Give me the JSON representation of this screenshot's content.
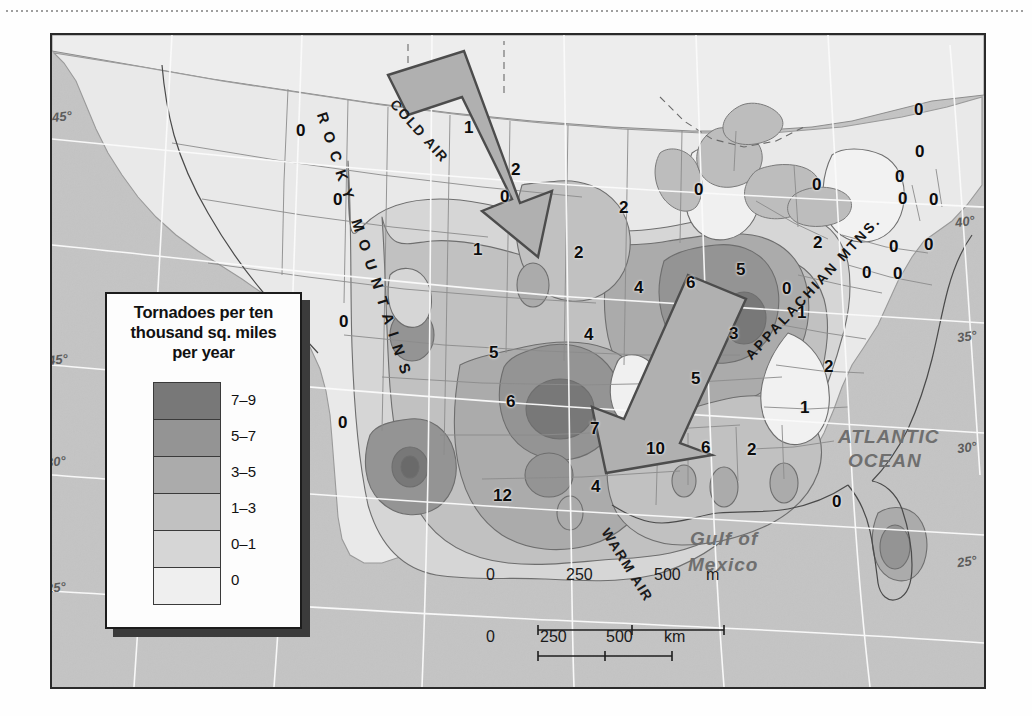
{
  "legend": {
    "title": "Tornadoes per ten thousand sq. miles per year",
    "title_lines": [
      "Tornadoes per ten",
      "thousand sq. miles",
      "per year"
    ],
    "entries": [
      {
        "label": "7–9",
        "color": "#787878"
      },
      {
        "label": "5–7",
        "color": "#949494"
      },
      {
        "label": "3–5",
        "color": "#ababab"
      },
      {
        "label": "1–3",
        "color": "#c1c1c1"
      },
      {
        "label": "0–1",
        "color": "#d6d6d6"
      },
      {
        "label": "0",
        "color": "#efefef"
      }
    ]
  },
  "map": {
    "ocean_color": "#c4c4c4",
    "land_color": "#e8e8e8",
    "frame_color": "#2a2a2a",
    "geo_labels": [
      {
        "text": "ATLANTIC",
        "x": 838,
        "y": 438,
        "size": 19
      },
      {
        "text": "OCEAN",
        "x": 848,
        "y": 462,
        "size": 19
      },
      {
        "text": "Gulf of",
        "x": 690,
        "y": 540,
        "size": 19
      },
      {
        "text": "Mexico",
        "x": 688,
        "y": 566,
        "size": 19
      }
    ],
    "range_labels": [
      {
        "text": "ROCKY MOUNTAINS",
        "x": 330,
        "y": 110,
        "rotate": 72
      },
      {
        "text": "APPALACHIAN MTNS.",
        "x": 742,
        "y": 352,
        "rotate": -47
      }
    ],
    "air_arrows": [
      {
        "text": "COLD AIR",
        "x": 399,
        "y": 96,
        "rotate": 48
      },
      {
        "text": "WARM AIR",
        "x": 612,
        "y": 525,
        "rotate": 58
      }
    ],
    "grid_labels_left": [
      {
        "text": "45°",
        "x": 52,
        "y": 117
      },
      {
        "text": "45°",
        "x": 48,
        "y": 360
      },
      {
        "text": "30°",
        "x": 46,
        "y": 462
      },
      {
        "text": "25°",
        "x": 46,
        "y": 588
      }
    ],
    "grid_labels_right": [
      {
        "text": "40°",
        "x": 955,
        "y": 222
      },
      {
        "text": "35°",
        "x": 957,
        "y": 337
      },
      {
        "text": "30°",
        "x": 957,
        "y": 448
      },
      {
        "text": "25°",
        "x": 957,
        "y": 562
      }
    ],
    "data_values": [
      {
        "value": "0",
        "x": 302,
        "y": 131
      },
      {
        "value": "1",
        "x": 470,
        "y": 128
      },
      {
        "value": "2",
        "x": 517,
        "y": 170
      },
      {
        "value": "0",
        "x": 506,
        "y": 197
      },
      {
        "value": "0",
        "x": 700,
        "y": 190
      },
      {
        "value": "2",
        "x": 625,
        "y": 208
      },
      {
        "value": "0",
        "x": 818,
        "y": 185
      },
      {
        "value": "0",
        "x": 920,
        "y": 110
      },
      {
        "value": "0",
        "x": 921,
        "y": 152
      },
      {
        "value": "0",
        "x": 901,
        "y": 177
      },
      {
        "value": "0",
        "x": 904,
        "y": 199
      },
      {
        "value": "0",
        "x": 935,
        "y": 200
      },
      {
        "value": "1",
        "x": 479,
        "y": 250
      },
      {
        "value": "2",
        "x": 580,
        "y": 253
      },
      {
        "value": "4",
        "x": 640,
        "y": 288
      },
      {
        "value": "6",
        "x": 692,
        "y": 283
      },
      {
        "value": "5",
        "x": 742,
        "y": 270
      },
      {
        "value": "2",
        "x": 819,
        "y": 243
      },
      {
        "value": "0",
        "x": 895,
        "y": 247
      },
      {
        "value": "0",
        "x": 930,
        "y": 245
      },
      {
        "value": "0",
        "x": 788,
        "y": 289
      },
      {
        "value": "0",
        "x": 868,
        "y": 273
      },
      {
        "value": "0",
        "x": 899,
        "y": 274
      },
      {
        "value": "1",
        "x": 803,
        "y": 313
      },
      {
        "value": "0",
        "x": 339,
        "y": 200
      },
      {
        "value": "0",
        "x": 345,
        "y": 322
      },
      {
        "value": "0",
        "x": 344,
        "y": 423
      },
      {
        "value": "3",
        "x": 735,
        "y": 334
      },
      {
        "value": "4",
        "x": 590,
        "y": 335
      },
      {
        "value": "5",
        "x": 495,
        "y": 353
      },
      {
        "value": "2",
        "x": 830,
        "y": 367
      },
      {
        "value": "5",
        "x": 697,
        "y": 379
      },
      {
        "value": "6",
        "x": 512,
        "y": 402
      },
      {
        "value": "1",
        "x": 806,
        "y": 408
      },
      {
        "value": "7",
        "x": 596,
        "y": 429
      },
      {
        "value": "10",
        "x": 652,
        "y": 449
      },
      {
        "value": "6",
        "x": 707,
        "y": 448
      },
      {
        "value": "2",
        "x": 753,
        "y": 450
      },
      {
        "value": "12",
        "x": 499,
        "y": 496
      },
      {
        "value": "4",
        "x": 597,
        "y": 487
      },
      {
        "value": "0",
        "x": 838,
        "y": 502
      }
    ]
  },
  "scale": {
    "miles": {
      "ticks": [
        "0",
        "250",
        "500"
      ],
      "unit": "m"
    },
    "km": {
      "ticks": [
        "0",
        "250",
        "500"
      ],
      "unit": "km"
    }
  }
}
